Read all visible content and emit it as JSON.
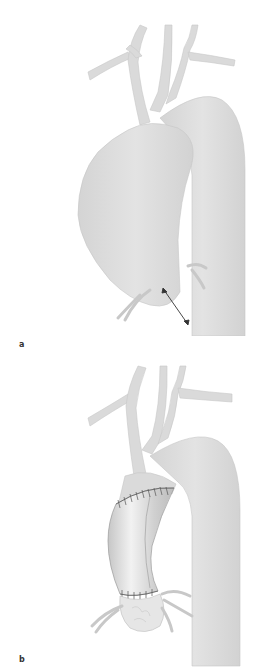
{
  "figure": {
    "panels": [
      {
        "id": "a",
        "label": "a",
        "description": "Aortic arch with ascending aortic aneurysm; double-headed arrow indicating dimension"
      },
      {
        "id": "b",
        "label": "b",
        "description": "Aortic arch after tube graft replacement of ascending aorta with sutured anastomoses"
      }
    ],
    "colors": {
      "vessel_fill": "#dcdcdc",
      "vessel_edge": "#c4c4c4",
      "graft_fill": "#cfcfcf",
      "graft_highlight": "#efefef",
      "suture": "#555555",
      "arrow": "#333333",
      "background": "#ffffff"
    }
  }
}
